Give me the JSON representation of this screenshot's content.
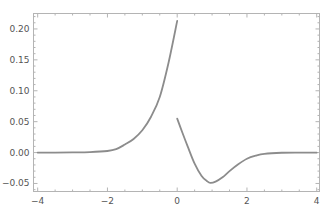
{
  "chart_data": {
    "type": "line",
    "title": "",
    "xlabel": "",
    "ylabel": "",
    "xlim": [
      -4.12,
      4.08
    ],
    "ylim": [
      -0.063,
      0.225
    ],
    "grid": false,
    "legend": null,
    "x_ticks": [
      {
        "value": -4,
        "label": "−4"
      },
      {
        "value": -2,
        "label": "−2"
      },
      {
        "value": 0,
        "label": "0"
      },
      {
        "value": 2,
        "label": "2"
      },
      {
        "value": 4,
        "label": "4"
      }
    ],
    "y_ticks": [
      {
        "value": -0.05,
        "label": "−0.05"
      },
      {
        "value": 0.0,
        "label": "0.00"
      },
      {
        "value": 0.05,
        "label": "0.05"
      },
      {
        "value": 0.1,
        "label": "0.10"
      },
      {
        "value": 0.15,
        "label": "0.15"
      },
      {
        "value": 0.2,
        "label": "0.20"
      }
    ],
    "series": [
      {
        "name": "left-branch",
        "color": "#8c8c8c",
        "x": [
          -4.0,
          -3.5,
          -3.0,
          -2.5,
          -2.0,
          -1.75,
          -1.5,
          -1.25,
          -1.0,
          -0.75,
          -0.5,
          -0.25,
          0.0
        ],
        "y": [
          0.0,
          0.0,
          0.0002,
          0.0007,
          0.0025,
          0.0055,
          0.013,
          0.022,
          0.036,
          0.058,
          0.09,
          0.145,
          0.213
        ]
      },
      {
        "name": "right-branch",
        "color": "#8c8c8c",
        "x": [
          0.0,
          0.15,
          0.3,
          0.5,
          0.7,
          0.85,
          0.95,
          1.1,
          1.3,
          1.5,
          1.75,
          2.0,
          2.25,
          2.5,
          3.0,
          3.5,
          4.0
        ],
        "y": [
          0.055,
          0.032,
          0.01,
          -0.018,
          -0.038,
          -0.046,
          -0.049,
          -0.047,
          -0.04,
          -0.03,
          -0.019,
          -0.01,
          -0.005,
          -0.002,
          -0.0003,
          0.0,
          0.0
        ]
      }
    ]
  }
}
